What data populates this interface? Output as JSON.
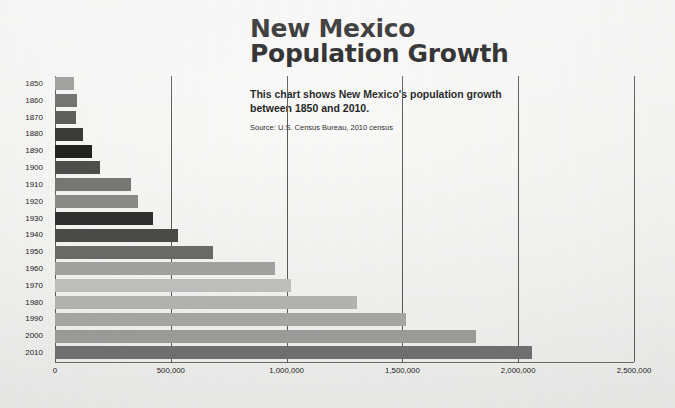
{
  "header": {
    "title": "New Mexico\nPopulation Growth",
    "subtitle": "This chart shows New Mexico's population growth\nbetween 1850 and 2010.",
    "source": "Source: U.S. Census Bureau, 2010 census"
  },
  "chart_data": {
    "type": "bar",
    "orientation": "horizontal",
    "title": "New Mexico Population Growth",
    "subtitle": "This chart shows New Mexico's population growth between 1850 and 2010.",
    "source": "Source: U.S. Census Bureau, 2010 census",
    "xlabel": "",
    "ylabel": "",
    "xlim": [
      0,
      2500000
    ],
    "ylim": null,
    "grid": true,
    "legend": false,
    "legend_position": "none",
    "xticks": [
      0,
      500000,
      1000000,
      1500000,
      2000000,
      2500000
    ],
    "xtick_labels": [
      "0",
      "500,000",
      "1,000,000",
      "1,500,000",
      "2,000,000",
      "2,500,000"
    ],
    "categories": [
      "1850",
      "1860",
      "1870",
      "1880",
      "1890",
      "1900",
      "1910",
      "1920",
      "1930",
      "1940",
      "1950",
      "1960",
      "1970",
      "1980",
      "1990",
      "2000",
      "2010"
    ],
    "values": [
      82000,
      94000,
      92000,
      120000,
      160000,
      195000,
      327000,
      360000,
      423000,
      532000,
      681000,
      951000,
      1017000,
      1303000,
      1515000,
      1819000,
      2059000
    ],
    "bar_colors": [
      "#9a9a98",
      "#6e6e6c",
      "#5d5d5b",
      "#3a3a39",
      "#232322",
      "#4e4e4c",
      "#777775",
      "#8b8b89",
      "#2f2f2e",
      "#4a4a48",
      "#6a6a68",
      "#a3a3a1",
      "#c0c0be",
      "#b5b5b3",
      "#a8a8a6",
      "#9d9d9b",
      "#717170"
    ],
    "axis_color": "#5a5a58",
    "background_color": "#f4f4f2"
  }
}
